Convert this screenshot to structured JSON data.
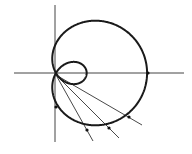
{
  "diagram": {
    "type": "polar-curve",
    "curve": "limacon with inner loop",
    "width": 192,
    "height": 154,
    "stroke_color": "#1a1a1a",
    "axis_color": "#444444",
    "pole": [
      56,
      75
    ],
    "axes": {
      "horizontal": {
        "x1": 14,
        "x2": 184,
        "y": 73
      },
      "vertical": {
        "x": 55,
        "y1": 5,
        "y2": 142
      }
    },
    "limacon": {
      "a": 30.5,
      "b": 61.5
    },
    "rays": [
      {
        "to": [
          93,
          141
        ]
      },
      {
        "to": [
          119,
          138
        ]
      },
      {
        "to": [
          142,
          125
        ]
      }
    ],
    "points": [
      [
        56,
        107
      ],
      [
        87,
        130
      ],
      [
        109,
        128
      ],
      [
        129,
        117
      ],
      [
        148,
        73
      ]
    ]
  }
}
